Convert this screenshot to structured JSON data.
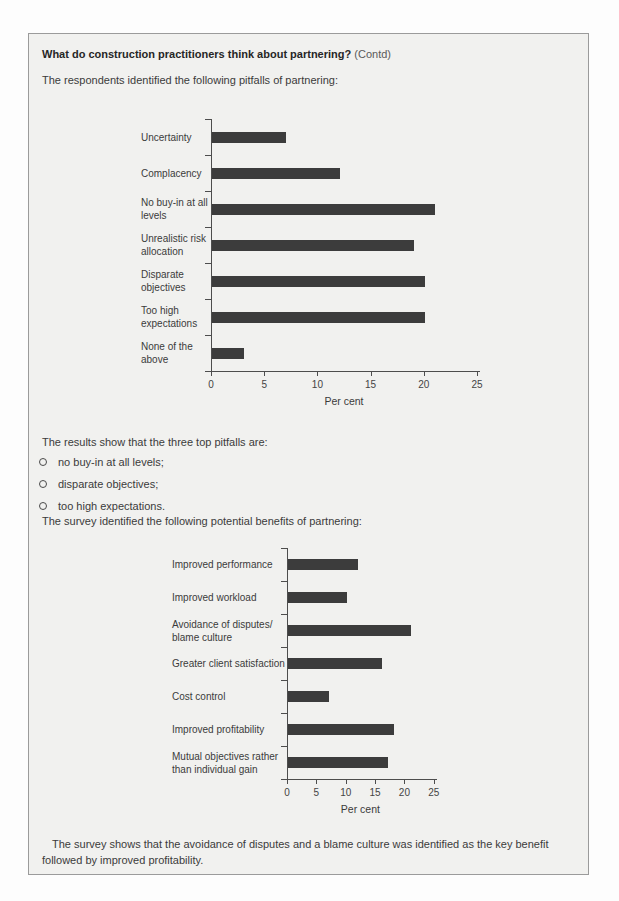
{
  "page": {
    "title": "What do construction practitioners think about partnering?",
    "title_suffix": "(Contd)",
    "intro": "The respondents identified the following pitfalls of partnering:",
    "results_intro": "The results show that the three top pitfalls are:",
    "bullets": [
      "no buy-in at all levels;",
      "disparate objectives;",
      "too high expectations."
    ],
    "benefits_intro": "The survey identified the following potential benefits of partnering:",
    "conclusion": "The survey shows that the avoidance of disputes and a blame culture was identified as the key benefit followed by improved profitability."
  },
  "chart_data": [
    {
      "id": "pitfalls-of-partnering",
      "type": "bar",
      "orientation": "horizontal",
      "categories": [
        "Uncertainty",
        "Complacency",
        "No buy-in at all levels",
        "Unrealistic risk allocation",
        "Disparate objectives",
        "Too high expectations",
        "None of the above"
      ],
      "values": [
        7,
        12,
        21,
        19,
        20,
        20,
        3
      ],
      "title": "",
      "xlabel": "Per cent",
      "ylabel": "",
      "xlim": [
        0,
        25
      ],
      "xticks": [
        0,
        5,
        10,
        15,
        20,
        25
      ],
      "grid": false,
      "legend": false,
      "bar_color": "#3c3c3c"
    },
    {
      "id": "benefits-of-partnering",
      "type": "bar",
      "orientation": "horizontal",
      "categories": [
        "Improved performance",
        "Improved workload",
        "Avoidance of disputes/ blame culture",
        "Greater client satisfaction",
        "Cost control",
        "Improved profitability",
        "Mutual objectives rather than individual gain"
      ],
      "values": [
        12,
        10,
        21,
        16,
        7,
        18,
        17
      ],
      "title": "",
      "xlabel": "Per cent",
      "ylabel": "",
      "xlim": [
        0,
        25
      ],
      "xticks": [
        0,
        5,
        10,
        15,
        20,
        25
      ],
      "grid": false,
      "legend": false,
      "bar_color": "#3c3c3c"
    }
  ]
}
